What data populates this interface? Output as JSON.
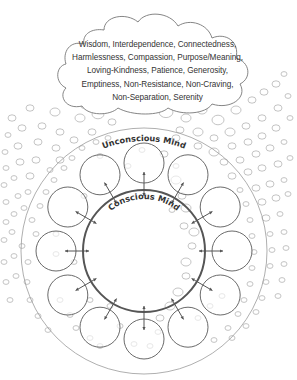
{
  "cloud": {
    "lines": [
      "Wisdom, Interdependence, Connectedness,",
      "Harmlessness, Compassion, Purpose/Meaning,",
      "Loving-Kindness, Patience, Generosity,",
      "Emptiness, Non-Resistance, Non-Craving,",
      "Non-Separation, Serenity"
    ]
  },
  "labels": {
    "unconscious": "Unconscious Mind",
    "conscious": "Conscious Mind"
  },
  "geometry": {
    "center": [
      144,
      251
    ],
    "outer_radius": 123,
    "conscious_radius": 61,
    "ring_distance": 88,
    "small_circle_radius": 20,
    "small_circle_count": 12,
    "arrow_outer": 79,
    "arrow_inner": 55
  },
  "colors": {
    "outer_circle": "#9a9a9a",
    "conscious_circle": "#555555",
    "small_circle": "#6a6a6a",
    "arrow": "#555555",
    "bubble": "#b5b5b5",
    "cloud_stroke": "#777777",
    "text": "#333333"
  },
  "bubbles": [
    [
      12,
      118,
      4
    ],
    [
      30,
      108,
      4
    ],
    [
      55,
      112,
      5
    ],
    [
      8,
      135,
      3
    ],
    [
      22,
      128,
      4
    ],
    [
      42,
      126,
      4
    ],
    [
      60,
      132,
      4
    ],
    [
      80,
      118,
      5
    ],
    [
      98,
      114,
      6
    ],
    [
      112,
      122,
      4
    ],
    [
      5,
      152,
      3
    ],
    [
      18,
      146,
      4
    ],
    [
      38,
      142,
      4
    ],
    [
      56,
      148,
      4
    ],
    [
      74,
      140,
      4
    ],
    [
      92,
      132,
      4
    ],
    [
      6,
      168,
      3
    ],
    [
      20,
      162,
      4
    ],
    [
      36,
      160,
      4
    ],
    [
      50,
      170,
      3
    ],
    [
      4,
      185,
      3
    ],
    [
      14,
      178,
      3
    ],
    [
      30,
      176,
      4
    ],
    [
      6,
      202,
      3
    ],
    [
      18,
      196,
      3
    ],
    [
      28,
      192,
      3
    ],
    [
      6,
      222,
      3
    ],
    [
      14,
      214,
      3
    ],
    [
      24,
      208,
      3
    ],
    [
      4,
      240,
      3
    ],
    [
      12,
      232,
      3
    ],
    [
      4,
      262,
      3
    ],
    [
      14,
      256,
      3
    ],
    [
      6,
      282,
      3
    ],
    [
      16,
      276,
      3
    ],
    [
      10,
      300,
      3
    ],
    [
      22,
      246,
      3
    ],
    [
      28,
      262,
      3
    ],
    [
      27,
      282,
      3
    ],
    [
      30,
      300,
      3
    ],
    [
      38,
      316,
      3
    ],
    [
      48,
      330,
      3
    ],
    [
      36,
      234,
      3
    ],
    [
      32,
      220,
      3
    ],
    [
      40,
      206,
      3
    ],
    [
      46,
      192,
      3
    ],
    [
      54,
      180,
      3
    ],
    [
      64,
      168,
      3
    ],
    [
      72,
      158,
      3
    ],
    [
      82,
      148,
      3
    ],
    [
      96,
      142,
      3
    ],
    [
      108,
      138,
      3
    ],
    [
      60,
      300,
      3
    ],
    [
      70,
      315,
      3
    ],
    [
      76,
      328,
      3
    ],
    [
      90,
      338,
      3
    ],
    [
      100,
      346,
      3
    ],
    [
      166,
      112,
      7
    ],
    [
      186,
      118,
      5
    ],
    [
      202,
      110,
      5
    ],
    [
      218,
      120,
      6
    ],
    [
      236,
      110,
      5
    ],
    [
      252,
      100,
      4
    ],
    [
      264,
      92,
      4
    ],
    [
      276,
      84,
      4
    ],
    [
      284,
      74,
      3
    ],
    [
      180,
      130,
      4
    ],
    [
      198,
      132,
      5
    ],
    [
      214,
      138,
      4
    ],
    [
      230,
      132,
      5
    ],
    [
      246,
      126,
      4
    ],
    [
      262,
      118,
      4
    ],
    [
      278,
      108,
      4
    ],
    [
      288,
      96,
      3
    ],
    [
      176,
      138,
      4
    ],
    [
      198,
      146,
      4
    ],
    [
      214,
      152,
      5
    ],
    [
      232,
      146,
      4
    ],
    [
      248,
      142,
      4
    ],
    [
      262,
      136,
      4
    ],
    [
      276,
      128,
      4
    ],
    [
      290,
      118,
      3
    ],
    [
      224,
      162,
      4
    ],
    [
      240,
      160,
      4
    ],
    [
      256,
      154,
      4
    ],
    [
      270,
      148,
      4
    ],
    [
      284,
      142,
      3
    ],
    [
      232,
      176,
      4
    ],
    [
      248,
      172,
      4
    ],
    [
      262,
      168,
      4
    ],
    [
      278,
      164,
      4
    ],
    [
      290,
      158,
      3
    ],
    [
      240,
      190,
      3
    ],
    [
      256,
      188,
      4
    ],
    [
      270,
      184,
      4
    ],
    [
      284,
      180,
      3
    ],
    [
      246,
      204,
      3
    ],
    [
      262,
      202,
      4
    ],
    [
      276,
      198,
      4
    ],
    [
      288,
      194,
      3
    ],
    [
      250,
      220,
      3
    ],
    [
      266,
      218,
      4
    ],
    [
      280,
      214,
      3
    ],
    [
      252,
      236,
      3
    ],
    [
      270,
      234,
      3
    ],
    [
      284,
      232,
      3
    ],
    [
      254,
      252,
      3
    ],
    [
      272,
      250,
      3
    ],
    [
      286,
      248,
      3
    ],
    [
      252,
      268,
      3
    ],
    [
      270,
      266,
      3
    ],
    [
      284,
      264,
      3
    ],
    [
      250,
      284,
      3
    ],
    [
      266,
      282,
      3
    ],
    [
      282,
      280,
      3
    ],
    [
      244,
      300,
      3
    ],
    [
      262,
      298,
      3
    ],
    [
      278,
      296,
      3
    ],
    [
      238,
      314,
      3
    ],
    [
      256,
      312,
      3
    ],
    [
      228,
      328,
      3
    ],
    [
      246,
      326,
      3
    ],
    [
      214,
      340,
      3
    ],
    [
      232,
      338,
      3
    ],
    [
      198,
      318,
      3
    ],
    [
      210,
      306,
      3
    ],
    [
      222,
      296,
      3
    ],
    [
      186,
      262,
      5
    ],
    [
      186,
      276,
      4
    ],
    [
      178,
      292,
      5
    ],
    [
      192,
      246,
      4
    ],
    [
      176,
      180,
      5
    ],
    [
      182,
      196,
      4
    ],
    [
      186,
      208,
      5
    ],
    [
      172,
      210,
      3
    ],
    [
      164,
      154,
      4
    ],
    [
      176,
      166,
      3
    ],
    [
      100,
      156,
      3
    ],
    [
      128,
      166,
      3
    ],
    [
      142,
      150,
      3
    ],
    [
      184,
      226,
      4
    ],
    [
      194,
      232,
      5
    ],
    [
      170,
      306,
      5
    ],
    [
      160,
      318,
      4
    ],
    [
      158,
      332,
      3
    ],
    [
      150,
      346,
      3
    ],
    [
      134,
      344,
      3
    ],
    [
      60,
      160,
      4
    ],
    [
      84,
      196,
      3
    ],
    [
      56,
      234,
      3
    ],
    [
      56,
      254,
      3
    ],
    [
      74,
      262,
      3
    ],
    [
      90,
      300,
      3
    ],
    [
      110,
      306,
      3
    ],
    [
      120,
      326,
      3
    ],
    [
      94,
      80,
      4
    ],
    [
      110,
      84,
      4
    ],
    [
      96,
      96,
      3
    ],
    [
      72,
      96,
      4
    ],
    [
      84,
      106,
      3
    ],
    [
      78,
      88,
      3
    ]
  ]
}
